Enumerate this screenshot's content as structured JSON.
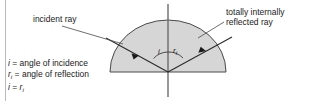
{
  "diagram": {
    "title_kind": "total-internal-reflection-diagram",
    "labels": {
      "incident_ray": "incident ray",
      "tir_line1": "totally internally",
      "tir_line2": "reflected ray"
    },
    "angles": {
      "incidence_symbol": "i",
      "reflection_symbol": "r",
      "reflection_subscript": "i"
    },
    "legend": {
      "line1_symbol": "i",
      "line1_text": " = angle of incidence",
      "line2_symbol": "r",
      "line2_subscript": "i",
      "line2_text": " = angle of reflection",
      "line3_left": "i",
      "line3_mid": " = ",
      "line3_right": "r",
      "line3_right_subscript": "i"
    },
    "colors": {
      "glass_fill": "#d6d6d6",
      "outline": "#4a4a4a",
      "ray": "#2b2b2b",
      "normal": "#6b6b6b",
      "text": "#1a1a1a",
      "border": "#b9b9b9",
      "background": "#ffffff"
    }
  }
}
